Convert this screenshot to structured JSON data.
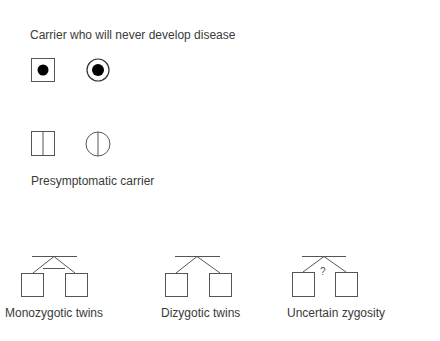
{
  "sections": {
    "carrier_never": {
      "label": "Carrier who will never develop disease",
      "symbols": [
        "male-carrier-dot-square",
        "female-carrier-dot-circle"
      ]
    },
    "presymptomatic": {
      "label": "Presymptomatic carrier",
      "symbols": [
        "male-presymptomatic-split-square",
        "female-presymptomatic-split-circle"
      ]
    },
    "twins": [
      {
        "label": "Monozygotic twins",
        "type": "monozygotic"
      },
      {
        "label": "Dizygotic twins",
        "type": "dizygotic"
      },
      {
        "label": "Uncertain zygosity",
        "type": "uncertain",
        "marker": "?"
      }
    ]
  },
  "colors": {
    "stroke": "#555555",
    "fill_dot": "#000000",
    "text": "#3a3a3a"
  }
}
